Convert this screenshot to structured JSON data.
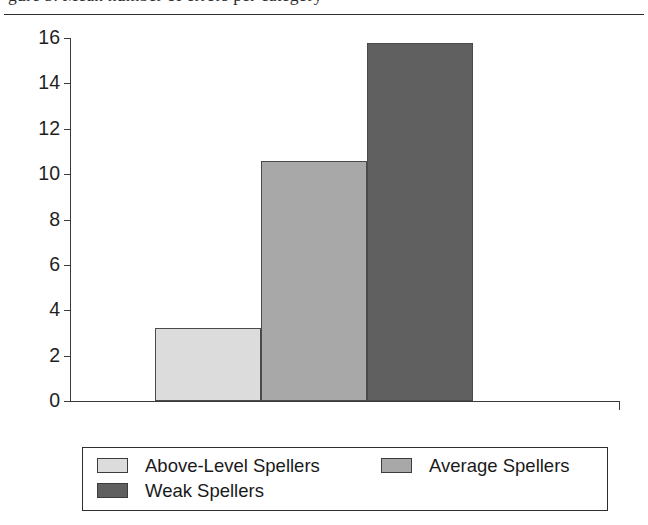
{
  "page": {
    "clipped_caption": "gure 5. Mean number of errors per category"
  },
  "chart_data": {
    "type": "bar",
    "title": "",
    "xlabel": "",
    "ylabel": "",
    "categories": [
      "Above-Level Spellers",
      "Average Spellers",
      "Weak Spellers"
    ],
    "values": [
      3.2,
      10.6,
      15.8
    ],
    "ylim": [
      0,
      16
    ],
    "yticks": [
      0,
      2,
      4,
      6,
      8,
      10,
      12,
      14,
      16
    ],
    "ytick_labels": [
      "0",
      "2",
      "4",
      "6",
      "8",
      "10",
      "12",
      "14",
      "16"
    ],
    "grid": false,
    "legend_position": "bottom",
    "bar_colors": [
      "#dcdcdc",
      "#a8a8a8",
      "#606060"
    ],
    "bar_border_color": "#4a4a4a"
  },
  "legend": {
    "entries": [
      {
        "label": "Above-Level Spellers",
        "color": "#dcdcdc"
      },
      {
        "label": "Average Spellers",
        "color": "#a8a8a8"
      },
      {
        "label": "Weak Spellers",
        "color": "#606060"
      }
    ]
  }
}
